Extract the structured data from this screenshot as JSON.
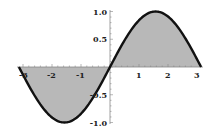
{
  "chart_data": {
    "type": "area",
    "title": "",
    "xlabel": "",
    "ylabel": "",
    "function": "sin(x)",
    "xlim": [
      -3.14159,
      3.14159
    ],
    "ylim": [
      -1.0,
      1.0
    ],
    "grid": false,
    "legend": null,
    "x_ticks": [
      "-3",
      "-2",
      "-1",
      "1",
      "2",
      "3"
    ],
    "y_ticks": [
      "1.0",
      "0.5",
      "-0.5",
      "-1.0"
    ],
    "x": [
      -3.14,
      -2.5,
      -2.0,
      -1.57,
      -1.0,
      -0.5,
      0,
      0.5,
      1.0,
      1.57,
      2.0,
      2.5,
      3.14
    ],
    "values": [
      0,
      -0.6,
      -0.91,
      -1.0,
      -0.84,
      -0.48,
      0,
      0.48,
      0.84,
      1.0,
      0.91,
      0.6,
      0
    ],
    "fill_to": 0,
    "colors": {
      "curve": "#111111",
      "fill": "#b8b8b8",
      "axis": "#888888"
    }
  }
}
